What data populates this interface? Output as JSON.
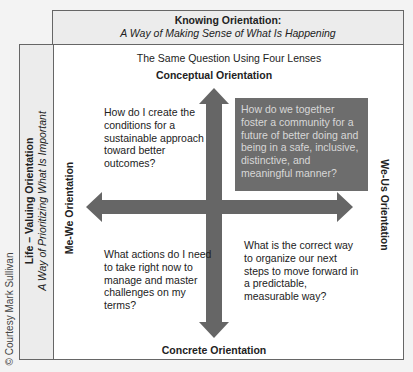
{
  "top_header": {
    "title": "Knowing Orientation:",
    "subtitle": "A Way of Making Sense of What Is Happening"
  },
  "left_header": {
    "title": "Life – Valuing Orientation",
    "subtitle": "A Way of Prioritizing What Is Important"
  },
  "copyright": "© Courtesy Mark Sullivan",
  "diagram": {
    "subtitle": "The Same Question Using Four Lenses",
    "axes": {
      "top": "Conceptual Orientation",
      "bottom": "Concrete Orientation",
      "left": "Me-We Orientation",
      "right": "We-Us Orientation"
    },
    "quadrants": {
      "top_left": "How do I create the conditions for a sustainable approach toward better outcomes?",
      "top_right": "How do we together foster a community for a future of better doing and being in a safe, inclusive, distinctive, and meaningful manner?",
      "bottom_left": "What actions do I need to take right now to manage and master challenges on my terms?",
      "bottom_right": "What is the correct way to organize our next steps to move forward in a predictable, measurable way?"
    },
    "colors": {
      "arrow": "#666666",
      "highlight_box": "#6d6d6d",
      "highlight_text": "#d8d8d8",
      "header_bg": "#ececec"
    }
  }
}
